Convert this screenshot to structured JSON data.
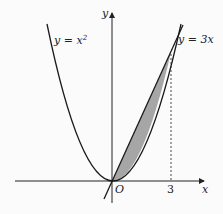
{
  "figure": {
    "curves": [
      {
        "name": "parabola",
        "equation": "y = x²",
        "label_text": "y = x",
        "label_sup": "2"
      },
      {
        "name": "line",
        "equation": "y = 3x",
        "label_text": "y = 3x"
      }
    ],
    "axes": {
      "x_label": "x",
      "y_label": "y",
      "origin_label": "O"
    },
    "ticks": {
      "x3": "3"
    },
    "shaded_region": {
      "between": [
        "y = 3x",
        "y = x²"
      ],
      "x_from": 0,
      "x_to": 3,
      "color": "#a6a6a6"
    },
    "intersection": {
      "x": 3,
      "y": 9
    },
    "colors": {
      "curve": "#1a1a1a",
      "shade": "#a6a6a6",
      "background": "#fbfbfb"
    }
  }
}
